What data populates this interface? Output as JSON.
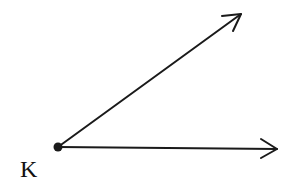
{
  "diagram": {
    "type": "angle",
    "vertex": {
      "label": "K",
      "x": 58,
      "y": 147
    },
    "rays": [
      {
        "name": "upper-ray",
        "x2": 241,
        "y2": 14
      },
      {
        "name": "horizontal-ray",
        "x2": 277,
        "y2": 149
      }
    ],
    "colors": {
      "stroke": "#1a1a1a",
      "background": "#ffffff"
    }
  }
}
